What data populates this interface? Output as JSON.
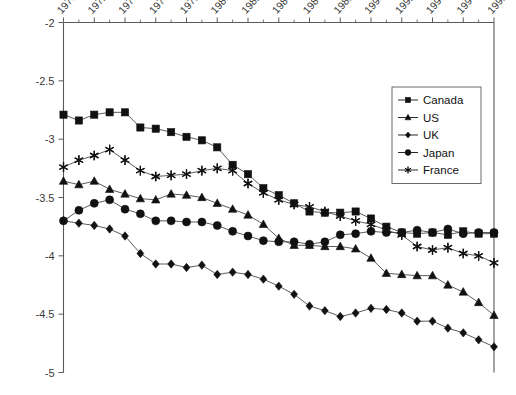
{
  "chart_data": {
    "type": "line",
    "title": "",
    "xlabel": "",
    "ylabel": "",
    "xlim": [
      1970,
      1998
    ],
    "ylim": [
      -5,
      -2
    ],
    "yticks": [
      "-2",
      "-2.5",
      "-3",
      "-3.5",
      "-4",
      "-4.5",
      "-5"
    ],
    "ytick_values": [
      -2,
      -2.5,
      -3,
      -3.5,
      -4,
      -4.5,
      -5
    ],
    "xticks": [
      "1970",
      "1972",
      "1974",
      "1976",
      "1978",
      "1980",
      "1982",
      "1984",
      "1986",
      "1988",
      "1990",
      "1992",
      "1994",
      "1996",
      "1998"
    ],
    "xtick_values": [
      1970,
      1972,
      1974,
      1976,
      1978,
      1980,
      1982,
      1984,
      1986,
      1988,
      1990,
      1992,
      1994,
      1996,
      1998
    ],
    "minor_xticks": true,
    "grid": false,
    "legend_position": "upper-right",
    "x": [
      1970,
      1971,
      1972,
      1973,
      1974,
      1975,
      1976,
      1977,
      1978,
      1979,
      1980,
      1981,
      1982,
      1983,
      1984,
      1985,
      1986,
      1987,
      1988,
      1989,
      1990,
      1991,
      1992,
      1993,
      1994,
      1995,
      1996,
      1997,
      1998
    ],
    "series": [
      {
        "name": "Canada",
        "marker": "square",
        "values": [
          -2.79,
          -2.84,
          -2.79,
          -2.77,
          -2.77,
          -2.9,
          -2.91,
          -2.94,
          -2.98,
          -3.01,
          -3.07,
          -3.22,
          -3.3,
          -3.42,
          -3.48,
          -3.55,
          -3.62,
          -3.63,
          -3.63,
          -3.62,
          -3.68,
          -3.75,
          -3.8,
          -3.81,
          -3.8,
          -3.82,
          -3.79,
          -3.81,
          -3.81
        ]
      },
      {
        "name": "US",
        "marker": "triangle",
        "values": [
          -3.36,
          -3.39,
          -3.36,
          -3.43,
          -3.47,
          -3.51,
          -3.52,
          -3.47,
          -3.48,
          -3.5,
          -3.55,
          -3.6,
          -3.65,
          -3.73,
          -3.85,
          -3.91,
          -3.91,
          -3.92,
          -3.92,
          -3.94,
          -4.02,
          -4.15,
          -4.16,
          -4.17,
          -4.17,
          -4.25,
          -4.31,
          -4.4,
          -4.51
        ]
      },
      {
        "name": "UK",
        "marker": "diamond",
        "values": [
          -3.7,
          -3.72,
          -3.74,
          -3.77,
          -3.83,
          -3.98,
          -4.07,
          -4.07,
          -4.1,
          -4.08,
          -4.16,
          -4.14,
          -4.16,
          -4.2,
          -4.26,
          -4.33,
          -4.43,
          -4.47,
          -4.52,
          -4.49,
          -4.45,
          -4.46,
          -4.49,
          -4.56,
          -4.56,
          -4.62,
          -4.66,
          -4.72,
          -4.78
        ]
      },
      {
        "name": "Japan",
        "marker": "circle",
        "values": [
          -3.7,
          -3.61,
          -3.55,
          -3.52,
          -3.6,
          -3.64,
          -3.7,
          -3.7,
          -3.71,
          -3.71,
          -3.74,
          -3.79,
          -3.83,
          -3.87,
          -3.88,
          -3.88,
          -3.9,
          -3.88,
          -3.82,
          -3.81,
          -3.79,
          -3.8,
          -3.8,
          -3.78,
          -3.8,
          -3.77,
          -3.81,
          -3.8,
          -3.8
        ]
      },
      {
        "name": "France",
        "marker": "asterisk",
        "values": [
          -3.24,
          -3.18,
          -3.14,
          -3.09,
          -3.18,
          -3.27,
          -3.32,
          -3.31,
          -3.3,
          -3.27,
          -3.25,
          -3.27,
          -3.38,
          -3.46,
          -3.52,
          -3.56,
          -3.58,
          -3.62,
          -3.66,
          -3.7,
          -3.73,
          -3.78,
          -3.82,
          -3.92,
          -3.95,
          -3.93,
          -3.98,
          -4.0,
          -4.06
        ]
      }
    ]
  },
  "legend": {
    "items": [
      {
        "label": "Canada",
        "marker": "square"
      },
      {
        "label": "US",
        "marker": "triangle"
      },
      {
        "label": "UK",
        "marker": "diamond"
      },
      {
        "label": "Japan",
        "marker": "circle"
      },
      {
        "label": "France",
        "marker": "asterisk"
      }
    ]
  }
}
